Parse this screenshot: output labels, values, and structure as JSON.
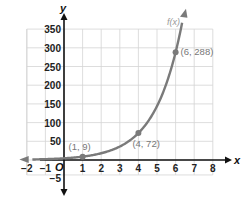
{
  "chart_data": {
    "type": "line",
    "title": "",
    "xlabel": "x",
    "ylabel": "y",
    "origin_label": "O",
    "function_label": "f(x)",
    "xlim": [
      -2.5,
      8
    ],
    "ylim": [
      -15,
      370
    ],
    "x_ticks": [
      -2,
      -1,
      1,
      2,
      3,
      4,
      5,
      6,
      7,
      8
    ],
    "x_tick_labels": [
      "−2",
      "−1",
      "1",
      "2",
      "3",
      "4",
      "5",
      "6",
      "7",
      "8"
    ],
    "y_ticks": [
      -5,
      50,
      100,
      150,
      200,
      250,
      300,
      350
    ],
    "y_tick_labels": [
      "−5",
      "50",
      "100",
      "150",
      "200",
      "250",
      "300",
      "350"
    ],
    "grid": true,
    "legend": "none",
    "series": [
      {
        "name": "f(x)",
        "formula": "f(x) = 4.5 * 2^x",
        "color": "#7a7a7a",
        "points": [
          {
            "x": 1,
            "y": 9,
            "label": "(1, 9)"
          },
          {
            "x": 4,
            "y": 72,
            "label": "(4, 72)"
          },
          {
            "x": 6,
            "y": 288,
            "label": "(6, 288)"
          }
        ]
      }
    ]
  },
  "colors": {
    "grid": "#d4d4d4",
    "axis": "#111111",
    "curve": "#7a7a7a",
    "point_label": "#777777"
  }
}
